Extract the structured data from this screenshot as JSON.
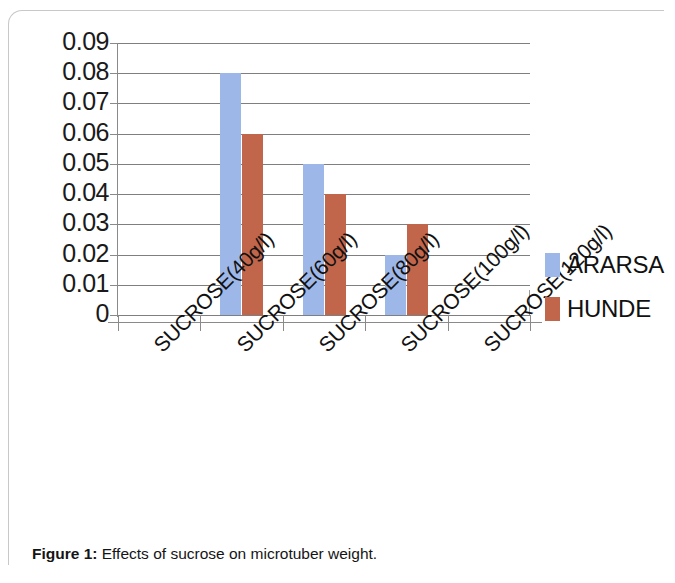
{
  "figure": {
    "caption_label": "Figure 1:",
    "caption_text": " Effects of sucrose on microtuber weight."
  },
  "legend": {
    "position": "right",
    "items": [
      {
        "label": "ARARSA",
        "color": "#9DB7E8"
      },
      {
        "label": "HUNDE",
        "color": "#C1664B"
      }
    ]
  },
  "axis": {
    "y_ticks": [
      "0.09",
      "0.08",
      "0.07",
      "0.06",
      "0.05",
      "0.04",
      "0.03",
      "0.02",
      "0.01",
      "0"
    ]
  },
  "chart_data": {
    "type": "bar",
    "title": "",
    "xlabel": "",
    "ylabel": "",
    "ylim": [
      0,
      0.09
    ],
    "ytick_step": 0.01,
    "grid": true,
    "legend_position": "right",
    "categories": [
      "SUCROSE(40g/l)",
      "SUCROSE(60g/l)",
      "SUCROSE(80g/l)",
      "SUCROSE(100g/l)",
      "SUCROSE(120g/l)"
    ],
    "series": [
      {
        "name": "ARARSA",
        "color": "#9DB7E8",
        "values": [
          0,
          0.08,
          0.05,
          0.02,
          0
        ]
      },
      {
        "name": "HUNDE",
        "color": "#C1664B",
        "values": [
          0,
          0.06,
          0.04,
          0.03,
          0
        ]
      }
    ]
  }
}
